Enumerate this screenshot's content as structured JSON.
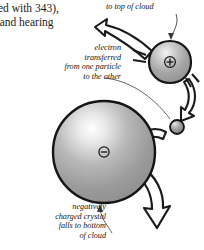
{
  "figure": {
    "background_color": "#ffffff",
    "ink_color": "#141414",
    "sphere_fill": "#9a9a9a",
    "sphere_highlight": "#f2f2f2"
  },
  "body_text": {
    "line1": "ared with 343),",
    "line2": "n and hearing"
  },
  "callouts": {
    "top_of_cloud": "to top of cloud",
    "electron_transfer": {
      "line1": "electron",
      "line2": "transferred",
      "line3": "from one particle",
      "line4": "to the other"
    },
    "negative_crystal": {
      "line1": "negatively",
      "line2": "charged crystal",
      "line3": "falls to bottom",
      "line4": "of cloud"
    }
  },
  "particles": {
    "positive": {
      "charge_symbol": "+",
      "label": "positively charged particle",
      "cx": 170,
      "cy": 62,
      "r": 21
    },
    "negative": {
      "charge_symbol": "−",
      "label": "negatively charged crystal",
      "cx": 104,
      "cy": 152,
      "r": 51
    },
    "electron": {
      "label": "transferred electron",
      "cx": 177,
      "cy": 127,
      "r": 7
    }
  },
  "arrows": {
    "up_left": "rises to top of cloud",
    "down_right_small": "falls from particle",
    "left_small": "electron moves to crystal",
    "down_right_large": "crystal falls to bottom of cloud"
  }
}
